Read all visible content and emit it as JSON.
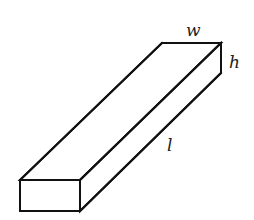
{
  "diagram": {
    "labels": {
      "width": "w",
      "height": "h",
      "length": "l"
    },
    "colors": {
      "stroke": "#111111",
      "fill": "#ffffff",
      "label": "#222222"
    }
  }
}
